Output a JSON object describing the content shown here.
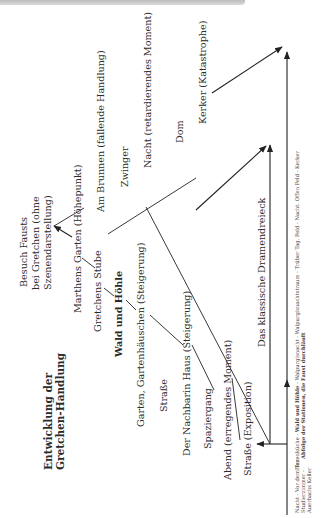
{
  "diagram": {
    "title_line1": "Entwicklung der",
    "title_line2": "Gretchen-Handlung",
    "triangle_label": "Das klassische Dramendreieck",
    "scenes": {
      "strasse_exposition": "Straße (Exposition)",
      "abend": "Abend (erregendes Moment)",
      "spaziergang": "Spaziergang",
      "nachbarin": "Der Nachbarin Haus (Steigerung)",
      "strasse": "Straße",
      "garten": "Garten, Gartenhäuschen (Steigerung)",
      "wald": "Wald und Höhle",
      "stube": "Gretchens Stube",
      "marthens": "Marthens Garten (Höhepunkt)",
      "besuch_1": "Besuch Fausts",
      "besuch_2": "bei Gretchen (ohne",
      "besuch_3": "Szenendarstellung)",
      "brunnen": "Am Brunnen (fallende Handlung)",
      "zwinger": "Zwinger",
      "nacht": "Nacht (retardierendes Moment)",
      "dom": "Dom",
      "kerker": "Kerker (Katastrophe)"
    },
    "notes": {
      "left_1": "Nacht - Vor dem Tor -",
      "left_2": "Studierzimmer -",
      "left_3": "Auerbachs Keller",
      "right_1_pre": "Hexenküche - ",
      "right_1_bold": "Wald und Höhle",
      "right_1_post": " - Walpurgisnacht - Walpurgisnachtstraum - Trüber Tag. Feld - Nacht. Offen Feld - Kerker",
      "right_2": "Abfolge der Stationen, die Faust durchläuft"
    }
  }
}
